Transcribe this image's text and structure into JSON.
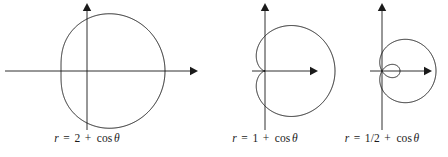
{
  "figure": {
    "width": 448,
    "height": 157,
    "background": "#ffffff",
    "stroke_color": "#1a1a1a",
    "curve_stroke_width": 1.0,
    "axis_stroke_width": 0.9
  },
  "chart_data": {
    "type": "line",
    "plot_kind": "polar",
    "title": "",
    "shared_equation_form": "r = a + cos θ",
    "panels": [
      {
        "id": "panel-1",
        "caption": "r = 2 + cos θ",
        "caption_parts": {
          "lhs": "r",
          "equals": "=",
          "a": "2",
          "plus": "+",
          "fn": "cos",
          "theta": "θ"
        },
        "a": 2,
        "curve_shape": "convex limaçon (no dimple, no inner loop)",
        "r_at_0": 3,
        "r_at_90": 2,
        "r_at_180": 1,
        "r_at_270": 2,
        "r_min": 1,
        "r_max": 3,
        "x_range": [
          -1,
          3
        ],
        "y_range": [
          -2.049,
          2.049
        ],
        "origin_px": {
          "x": 87,
          "y": 71
        },
        "scale_px_per_unit": 26.0,
        "axes": {
          "x_axis": {
            "x1": 5,
            "y1": 71,
            "x2": 198,
            "y2": 71,
            "arrow": "right"
          },
          "y_axis": {
            "x1": 87,
            "y1": 130,
            "x2": 87,
            "y2": 3,
            "arrow": "up"
          }
        },
        "caption_y_px": 132
      },
      {
        "id": "panel-2",
        "caption": "r = 1 + cos θ",
        "caption_parts": {
          "lhs": "r",
          "equals": "=",
          "a": "1",
          "plus": "+",
          "fn": "cos",
          "theta": "θ"
        },
        "a": 1,
        "curve_shape": "cardioid (cusp at origin)",
        "r_at_0": 2,
        "r_at_90": 1,
        "r_at_180": 0,
        "r_at_270": 1,
        "r_min": 0,
        "r_max": 2,
        "x_range": [
          -0.25,
          2
        ],
        "y_range": [
          -1.299,
          1.299
        ],
        "origin_px": {
          "x": 265,
          "y": 71
        },
        "scale_px_per_unit": 35.0,
        "axes": {
          "x_axis": {
            "x1": 252,
            "y1": 71,
            "x2": 318,
            "y2": 71,
            "arrow": "right"
          },
          "y_axis": {
            "x1": 265,
            "y1": 130,
            "x2": 265,
            "y2": 3,
            "arrow": "up"
          }
        },
        "caption_y_px": 132
      },
      {
        "id": "panel-3",
        "caption": "r = 1/2 + cos θ",
        "caption_parts": {
          "lhs": "r",
          "equals": "=",
          "a": "1/2",
          "plus": "+",
          "fn": "cos",
          "theta": "θ"
        },
        "a": 0.5,
        "curve_shape": "limaçon with inner loop",
        "r_at_0": 1.5,
        "r_at_90": 0.5,
        "r_at_180": -0.5,
        "r_at_270": 0.5,
        "r_min": -0.5,
        "r_max": 1.5,
        "inner_loop": true,
        "loop_theta_range_deg": [
          120,
          240
        ],
        "x_range": [
          -0.25,
          1.5
        ],
        "y_range": [
          -0.793,
          0.793
        ],
        "origin_px": {
          "x": 382,
          "y": 71
        },
        "scale_px_per_unit": 36.0,
        "axes": {
          "x_axis": {
            "x1": 370,
            "y1": 71,
            "x2": 432,
            "y2": 71,
            "arrow": "right"
          },
          "y_axis": {
            "x1": 382,
            "y1": 130,
            "x2": 382,
            "y2": 3,
            "arrow": "up"
          }
        },
        "caption_y_px": 132
      }
    ],
    "grid": false,
    "legend": false,
    "axis_labels": {
      "x": "",
      "y": ""
    }
  }
}
